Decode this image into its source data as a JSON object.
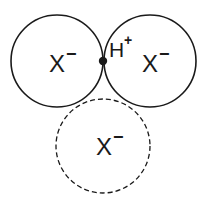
{
  "diagram": {
    "colors": {
      "stroke": "#1a1a1a",
      "background": "#ffffff"
    },
    "circles": [
      {
        "id": "left-anion",
        "label": "X",
        "charge": "−",
        "style": "solid"
      },
      {
        "id": "right-anion",
        "label": "X",
        "charge": "−",
        "style": "solid"
      },
      {
        "id": "bottom-anion",
        "label": "X",
        "charge": "−",
        "style": "dashed"
      }
    ],
    "proton": {
      "label": "H",
      "charge": "+"
    }
  }
}
